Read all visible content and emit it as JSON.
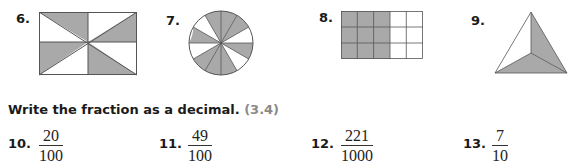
{
  "figures": [
    {
      "number": "6.",
      "shape": "rectangle",
      "parts": 8,
      "shaded": 4
    },
    {
      "number": "7.",
      "shape": "circle",
      "parts": 12,
      "shaded": 7
    },
    {
      "number": "8.",
      "shape": "grid",
      "rows": 3,
      "cols": 5,
      "parts": 15,
      "shaded": 9
    },
    {
      "number": "9.",
      "shape": "triangle",
      "parts": 3,
      "shaded": 2
    }
  ],
  "section": {
    "instruction": "Write the fraction as a decimal.",
    "reference": "(3.4)"
  },
  "problems": [
    {
      "number": "10.",
      "numerator": "20",
      "denominator": "100"
    },
    {
      "number": "11.",
      "numerator": "49",
      "denominator": "100"
    },
    {
      "number": "12.",
      "numerator": "221",
      "denominator": "1000"
    },
    {
      "number": "13.",
      "numerator": "7",
      "denominator": "10"
    }
  ],
  "colors": {
    "shade": "#a9a9a9",
    "line": "#555555"
  }
}
